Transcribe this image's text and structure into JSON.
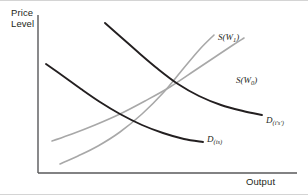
{
  "figure": {
    "background": "#ffffff",
    "frame_color": "#d4d4d4"
  },
  "axes": {
    "y_label": "Price\nLevel",
    "x_label": "Output",
    "axis_color": "#58585a",
    "origin": {
      "x": 38,
      "y": 172
    },
    "x_end": 297,
    "y_top": 14
  },
  "labels": {
    "supply_high": {
      "name": "S",
      "subscript": "W1",
      "arg": "W",
      "sub_digit": "1"
    },
    "supply_low": {
      "name": "S",
      "subscript": "W0",
      "arg": "W",
      "sub_digit": "0"
    },
    "demand_high": {
      "name": "D",
      "subscript": "(i's')"
    },
    "demand_low": {
      "name": "D",
      "subscript": "(is)"
    }
  },
  "chart_data": {
    "type": "line",
    "title": "",
    "xlabel": "Output",
    "ylabel": "Price Level",
    "grid": false,
    "legend": "none",
    "axis_ranges": {
      "x": [
        0,
        1
      ],
      "y": [
        0,
        1
      ]
    },
    "annotations": [
      "S(W1) lies above and left of S(W0): higher nominal wage shifts aggregate supply up-left",
      "D(i's') lies above and right of D(is): higher demand shifts aggregate demand out"
    ],
    "series": [
      {
        "name": "S(W1)",
        "label": "S(W_1)",
        "role": "aggregate-supply",
        "slope": "upward",
        "color": "#a8a8a8",
        "width": 1.6,
        "points": [
          [
            60,
            163
          ],
          [
            78,
            155
          ],
          [
            98,
            145
          ],
          [
            120,
            131
          ],
          [
            142,
            113
          ],
          [
            163,
            92
          ],
          [
            183,
            68
          ],
          [
            200,
            48
          ],
          [
            214,
            34
          ]
        ]
      },
      {
        "name": "S(W0)",
        "label": "S(W_0)",
        "role": "aggregate-supply",
        "slope": "upward",
        "color": "#a8a8a8",
        "width": 1.6,
        "points": [
          [
            52,
            140
          ],
          [
            72,
            133
          ],
          [
            95,
            124
          ],
          [
            120,
            113
          ],
          [
            145,
            100
          ],
          [
            170,
            86
          ],
          [
            194,
            70
          ],
          [
            215,
            56
          ],
          [
            233,
            44
          ],
          [
            244,
            37
          ]
        ]
      },
      {
        "name": "D(i's')",
        "label": "D_(i's')",
        "role": "aggregate-demand",
        "slope": "downward",
        "color": "#231f20",
        "width": 1.9,
        "points": [
          [
            105,
            22
          ],
          [
            122,
            37
          ],
          [
            139,
            52
          ],
          [
            158,
            68
          ],
          [
            178,
            83
          ],
          [
            199,
            95
          ],
          [
            221,
            104
          ],
          [
            243,
            110
          ],
          [
            262,
            114
          ]
        ]
      },
      {
        "name": "D(is)",
        "label": "D_(is)",
        "role": "aggregate-demand",
        "slope": "downward",
        "color": "#231f20",
        "width": 1.9,
        "points": [
          [
            46,
            63
          ],
          [
            63,
            75
          ],
          [
            81,
            88
          ],
          [
            100,
            101
          ],
          [
            120,
            113
          ],
          [
            142,
            124
          ],
          [
            163,
            132
          ],
          [
            184,
            138
          ],
          [
            203,
            141
          ]
        ]
      }
    ]
  }
}
